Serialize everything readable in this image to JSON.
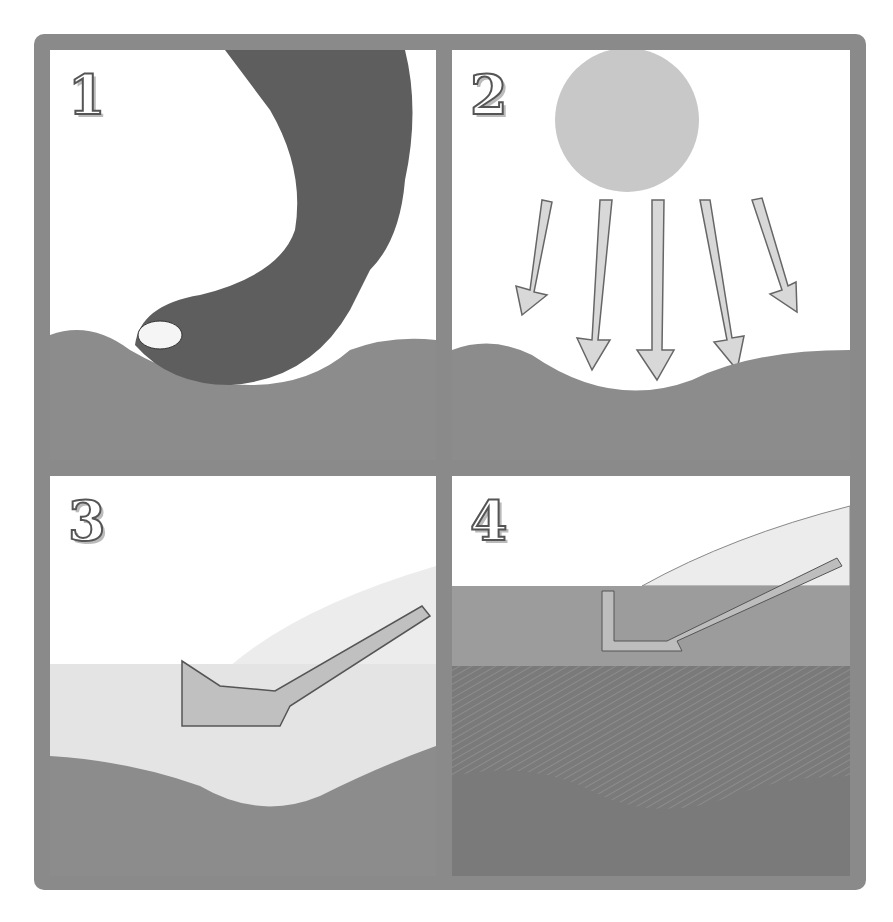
{
  "diagram": {
    "type": "four-panel illustrated process",
    "colors": {
      "frame": "#8a8a8a",
      "soil": "#8c8c8c",
      "dark_soil": "#6e6e6e",
      "sun": "#c8c8c8",
      "sky": "#ffffff"
    },
    "panels": [
      {
        "number": "1",
        "depicts": "hoof pressing into the soil surface"
      },
      {
        "number": "2",
        "depicts": "sun with arrows pointing down onto the dented soil"
      },
      {
        "number": "3",
        "depicts": "arrow depositing seeds/debris layer into the depression"
      },
      {
        "number": "4",
        "depicts": "layered soil with hatched mulch layer and new grass growth"
      }
    ]
  }
}
